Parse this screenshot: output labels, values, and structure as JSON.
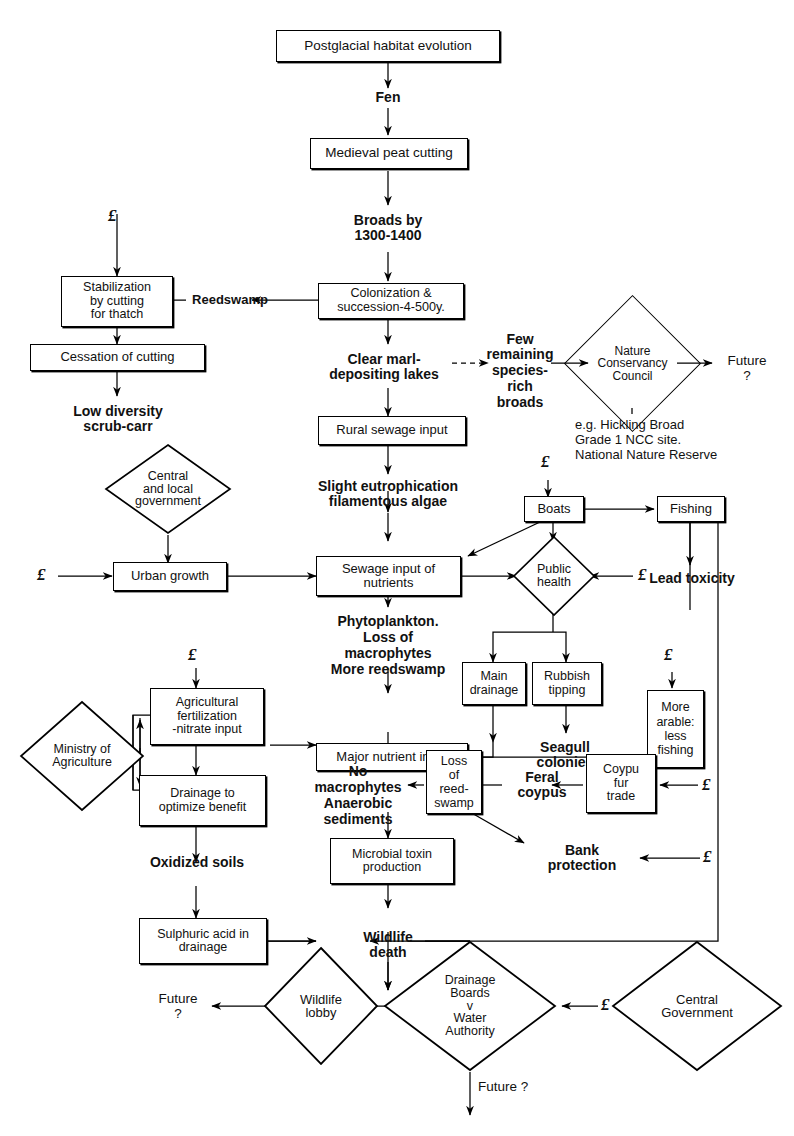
{
  "diagram": {
    "title": "Postglacial habitat evolution",
    "currency_symbol": "£",
    "nodes": {
      "postglacial": {
        "label": "Postglacial habitat evolution",
        "shape": "box"
      },
      "fen": {
        "label": "Fen",
        "shape": "text"
      },
      "medieval_peat": {
        "label": "Medieval peat cutting",
        "shape": "box"
      },
      "broads_by": {
        "label": "Broads by\n1300-1400",
        "line1": "Broads by",
        "line2": "1300-1400",
        "shape": "text"
      },
      "colonization": {
        "line1": "Colonization &",
        "line2": "succession-4-500y.",
        "shape": "box"
      },
      "reedswamp": {
        "label": "Reedswamp",
        "shape": "text"
      },
      "stabilization": {
        "line1": "Stabilization",
        "line2": "by cutting",
        "line3": "for  thatch",
        "shape": "box"
      },
      "cessation": {
        "label": "Cessation of cutting",
        "shape": "box"
      },
      "low_diversity": {
        "line1": "Low diversity",
        "line2": "scrub-carr",
        "shape": "text"
      },
      "clear_marl": {
        "line1": "Clear  marl-",
        "line2": "depositing lakes",
        "shape": "text"
      },
      "few_remaining": {
        "line1": "Few",
        "line2": "remaining",
        "line3": "species-",
        "line4": "rich",
        "line5": "broads",
        "shape": "text"
      },
      "ncc": {
        "line1": "Nature",
        "line2": "Conservancy",
        "line3": "Council",
        "shape": "diamond"
      },
      "ncc_future": {
        "line1": "Future",
        "line2": "?",
        "shape": "text"
      },
      "ncc_note": {
        "line1": "e.g. Hickling Broad",
        "line2": "Grade 1 NCC site.",
        "line3": "National Nature Reserve",
        "shape": "caption"
      },
      "rural_sewage": {
        "label": "Rural sewage input",
        "shape": "box"
      },
      "slight_eutro": {
        "line1": "Slight eutrophication",
        "line2": "filamentous algae",
        "shape": "text"
      },
      "central_local_gov": {
        "line1": "Central",
        "line2": "and  local",
        "line3": "government",
        "shape": "diamond"
      },
      "urban_growth": {
        "label": "Urban growth",
        "shape": "box"
      },
      "sewage_input": {
        "line1": "Sewage input of",
        "line2": "nutrients",
        "shape": "box"
      },
      "boats": {
        "label": "Boats",
        "shape": "box"
      },
      "fishing": {
        "label": "Fishing",
        "shape": "box"
      },
      "public_health": {
        "line1": "Public",
        "line2": "health",
        "shape": "diamond"
      },
      "lead_toxicity": {
        "label": "Lead toxicity",
        "shape": "text"
      },
      "phytoplankton": {
        "line1": "Phytoplankton.",
        "line2": "Loss of",
        "line3": "macrophytes",
        "line4": "More reedswamp",
        "shape": "text"
      },
      "main_drainage": {
        "line1": "Main",
        "line2": "drainage",
        "shape": "box"
      },
      "rubbish_tipping": {
        "line1": "Rubbish",
        "line2": "tipping",
        "shape": "box"
      },
      "seagull": {
        "line1": "Seagull",
        "line2": "colonies",
        "shape": "text"
      },
      "more_arable": {
        "line1": "More",
        "line2": "arable:",
        "line3": "less",
        "line4": "fishing",
        "shape": "box"
      },
      "ministry_ag": {
        "line1": "Ministry of",
        "line2": "Agriculture",
        "shape": "diamond"
      },
      "agri_fert": {
        "line1": "Agricultural",
        "line2": "fertilization",
        "line3": "-nitrate input",
        "shape": "box"
      },
      "drainage_opt": {
        "line1": "Drainage  to",
        "line2": "optimize benefit",
        "shape": "box"
      },
      "major_nutrient": {
        "label": "Major nutrient input",
        "shape": "box"
      },
      "no_macrophytes": {
        "line1": "No",
        "line2": "macrophytes",
        "line3": "Anaerobic",
        "line4": "sediments",
        "shape": "text"
      },
      "loss_reedswamp": {
        "line1": "Loss",
        "line2": "of",
        "line3": "reed-",
        "line4": "swamp",
        "shape": "box"
      },
      "feral_coypus": {
        "line1": "Feral",
        "line2": "coypus",
        "shape": "text"
      },
      "coypu_fur": {
        "line1": "Coypu",
        "line2": "fur",
        "line3": "trade",
        "shape": "box"
      },
      "bank_protection": {
        "line1": "Bank",
        "line2": "protection",
        "shape": "text"
      },
      "oxidized_soils": {
        "label": "Oxidized soils",
        "shape": "text"
      },
      "microbial_toxin": {
        "line1": "Microbial  toxin",
        "line2": "production",
        "shape": "box"
      },
      "sulphuric_acid": {
        "line1": "Sulphuric acid in",
        "line2": "drainage",
        "shape": "box"
      },
      "wildlife_death": {
        "line1": "Wildlife",
        "line2": "death",
        "shape": "text"
      },
      "wildlife_lobby": {
        "line1": "Wildlife",
        "line2": "lobby",
        "shape": "diamond"
      },
      "lobby_future": {
        "line1": "Future",
        "line2": "?",
        "shape": "text"
      },
      "drainage_boards": {
        "line1": "Drainage",
        "line2": "Boards",
        "line3": "v",
        "line4": "Water",
        "line5": "Authority",
        "shape": "diamond"
      },
      "db_future": {
        "label": "Future ?",
        "shape": "text"
      },
      "central_government": {
        "line1": "Central",
        "line2": "Government",
        "shape": "diamond"
      }
    },
    "money_markers": [
      {
        "id": "money-stabilization",
        "symbol": "£"
      },
      {
        "id": "money-boats",
        "symbol": "£"
      },
      {
        "id": "money-urban-growth",
        "symbol": "£"
      },
      {
        "id": "money-public-health",
        "symbol": "£"
      },
      {
        "id": "money-agri-fert",
        "symbol": "£"
      },
      {
        "id": "money-more-arable",
        "symbol": "£"
      },
      {
        "id": "money-coypu-fur",
        "symbol": "£"
      },
      {
        "id": "money-bank-protection",
        "symbol": "£"
      },
      {
        "id": "money-central-government",
        "symbol": "£"
      }
    ],
    "colors": {
      "ink": "#000000",
      "background": "#ffffff"
    }
  }
}
